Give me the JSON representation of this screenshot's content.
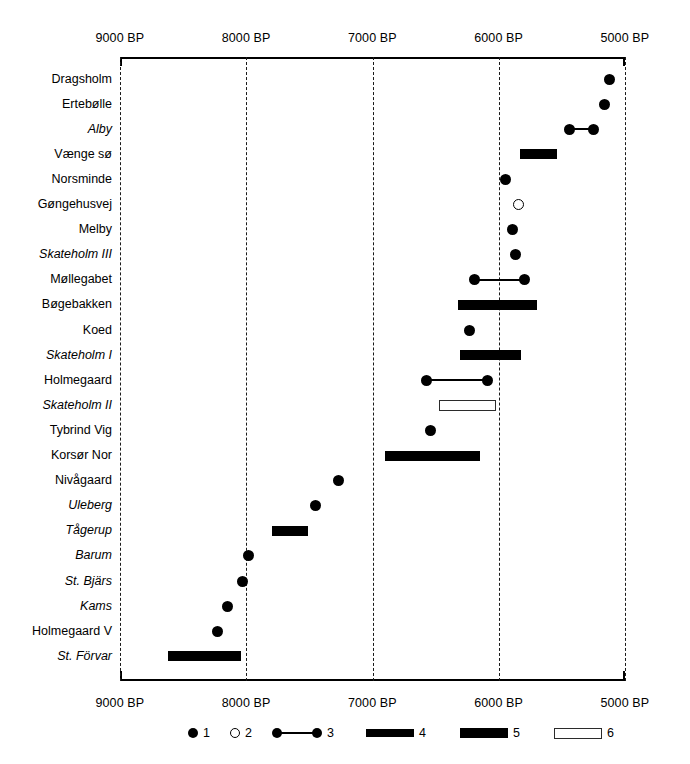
{
  "chart_data": {
    "type": "range_timeline",
    "title": "",
    "xlabel": "",
    "ylabel": "",
    "x_axis": {
      "unit": "BP",
      "direction": "decreasing",
      "xlim": [
        9000,
        5000
      ],
      "ticks": [
        9000,
        8000,
        7000,
        6000,
        5000
      ],
      "tick_labels_top": [
        "9000 BP",
        "8000 BP",
        "7000 BP",
        "6000 BP",
        "5000 BP"
      ],
      "tick_labels_bottom": [
        "9000 BP",
        "8000 BP",
        "7000 BP",
        "6000 BP",
        "5000 BP"
      ],
      "grid": true,
      "gridline_style": "dashed"
    },
    "legend": {
      "position": "bottom",
      "entries": [
        {
          "key": "1",
          "symbol": "filled-circle",
          "label": "1"
        },
        {
          "key": "2",
          "symbol": "open-circle",
          "label": "2"
        },
        {
          "key": "3",
          "symbol": "dumbbell-range",
          "label": "3"
        },
        {
          "key": "4",
          "symbol": "filled-bar-thin",
          "label": "4"
        },
        {
          "key": "5",
          "symbol": "filled-bar-thick",
          "label": "5"
        },
        {
          "key": "6",
          "symbol": "open-bar",
          "label": "6"
        }
      ]
    },
    "categories": [
      "Dragsholm",
      "Ertebølle",
      "Alby",
      "Vænge sø",
      "Norsminde",
      "Gøngehusvej",
      "Melby",
      "Skateholm III",
      "Møllegabet",
      "Bøgebakken",
      "Koed",
      "Skateholm I",
      "Holmegaard",
      "Skateholm II",
      "Tybrind Vig",
      "Korsør Nor",
      "Nivågaard",
      "Uleberg",
      "Tågerup",
      "Barum",
      "St. Bjärs",
      "Kams",
      "Holmegaard V",
      "St. Förvar"
    ],
    "rows": [
      {
        "name": "Dragsholm",
        "italic": false,
        "symbol": "filled-circle",
        "value": 5120
      },
      {
        "name": "Ertebølle",
        "italic": false,
        "symbol": "filled-circle",
        "value": 5160
      },
      {
        "name": "Alby",
        "italic": true,
        "symbol": "dumbbell-range",
        "start": 5440,
        "end": 5250
      },
      {
        "name": "Vænge sø",
        "italic": false,
        "symbol": "filled-bar-thick",
        "start": 5830,
        "end": 5540
      },
      {
        "name": "Norsminde",
        "italic": false,
        "symbol": "filled-circle",
        "value": 5950
      },
      {
        "name": "Gøngehusvej",
        "italic": false,
        "symbol": "open-circle",
        "value": 5840
      },
      {
        "name": "Melby",
        "italic": false,
        "symbol": "filled-circle",
        "value": 5890
      },
      {
        "name": "Skateholm III",
        "italic": true,
        "symbol": "filled-circle",
        "value": 5870
      },
      {
        "name": "Møllegabet",
        "italic": false,
        "symbol": "dumbbell-range",
        "start": 6190,
        "end": 5800
      },
      {
        "name": "Bøgebakken",
        "italic": false,
        "symbol": "filled-bar-thick",
        "start": 6320,
        "end": 5700
      },
      {
        "name": "Koed",
        "italic": false,
        "symbol": "filled-circle",
        "value": 6230
      },
      {
        "name": "Skateholm I",
        "italic": true,
        "symbol": "filled-bar-thick",
        "start": 6310,
        "end": 5820
      },
      {
        "name": "Holmegaard",
        "italic": false,
        "symbol": "dumbbell-range",
        "start": 6570,
        "end": 6090
      },
      {
        "name": "Skateholm II",
        "italic": true,
        "symbol": "open-bar",
        "start": 6470,
        "end": 6020
      },
      {
        "name": "Tybrind Vig",
        "italic": false,
        "symbol": "filled-circle",
        "value": 6540
      },
      {
        "name": "Korsør Nor",
        "italic": false,
        "symbol": "filled-bar-thick",
        "start": 6900,
        "end": 6150
      },
      {
        "name": "Nivågaard",
        "italic": false,
        "symbol": "filled-circle",
        "value": 7270
      },
      {
        "name": "Uleberg",
        "italic": true,
        "symbol": "filled-circle",
        "value": 7450
      },
      {
        "name": "Tågerup",
        "italic": true,
        "symbol": "filled-bar-thick",
        "start": 7800,
        "end": 7510
      },
      {
        "name": "Barum",
        "italic": true,
        "symbol": "filled-circle",
        "value": 7980
      },
      {
        "name": "St. Bjärs",
        "italic": true,
        "symbol": "filled-circle",
        "value": 8030
      },
      {
        "name": "Kams",
        "italic": true,
        "symbol": "filled-circle",
        "value": 8150
      },
      {
        "name": "Holmegaard V",
        "italic": false,
        "symbol": "filled-circle",
        "value": 8230
      },
      {
        "name": "St. Förvar",
        "italic": true,
        "symbol": "filled-bar-thick",
        "start": 8620,
        "end": 8040
      }
    ]
  }
}
